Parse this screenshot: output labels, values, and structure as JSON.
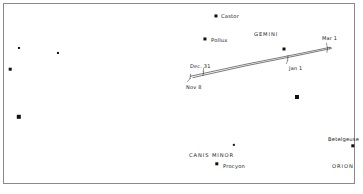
{
  "figure": {
    "kind": "star-chart",
    "background_color": "#ffffff",
    "frame_color": "#8a8a8a",
    "star_color": "#111111",
    "text_color": "#1a1a1a",
    "path_color": "#333333",
    "width": 363,
    "height": 194
  },
  "stars": [
    {
      "name": "castor-star",
      "x": 216,
      "y": 16,
      "size": 3.1
    },
    {
      "name": "pollux-star",
      "x": 205,
      "y": 39,
      "size": 3.1
    },
    {
      "name": "gemini-star-1",
      "x": 284,
      "y": 49,
      "size": 3.0
    },
    {
      "name": "field-star-left-1",
      "x": 19,
      "y": 48,
      "size": 2.1
    },
    {
      "name": "field-star-left-2",
      "x": 58,
      "y": 53,
      "size": 2.1
    },
    {
      "name": "field-star-left-3",
      "x": 10,
      "y": 69,
      "size": 2.6
    },
    {
      "name": "field-star-left-4",
      "x": 19,
      "y": 117,
      "size": 4.4
    },
    {
      "name": "field-star-mid-1",
      "x": 297,
      "y": 97,
      "size": 4.0
    },
    {
      "name": "canis-minor-star",
      "x": 234,
      "y": 145,
      "size": 2.3
    },
    {
      "name": "procyon-star",
      "x": 217,
      "y": 164,
      "size": 3.4
    },
    {
      "name": "betelgeuse-star",
      "x": 353,
      "y": 146,
      "size": 3.4
    }
  ],
  "star_labels": [
    {
      "name": "castor-label",
      "text": "Castor",
      "x": 221,
      "y": 16
    },
    {
      "name": "pollux-label",
      "text": "Pollux",
      "x": 211,
      "y": 40
    },
    {
      "name": "procyon-label",
      "text": "Procyon",
      "x": 223,
      "y": 166
    },
    {
      "name": "betelgeuse-label",
      "text": "Betelgeuse",
      "x": 328,
      "y": 139
    }
  ],
  "constellation_labels": [
    {
      "name": "gemini-label",
      "text": "GEMINI",
      "x": 254,
      "y": 34
    },
    {
      "name": "canis-minor-label",
      "text": "CANIS MINOR",
      "x": 189,
      "y": 155
    },
    {
      "name": "orion-label",
      "text": "ORION",
      "x": 332,
      "y": 166
    }
  ],
  "date_labels": [
    {
      "name": "date-label-nov-8",
      "text": "Nov 8",
      "x": 186,
      "y": 87
    },
    {
      "name": "date-label-dec-31",
      "text": "Dec. 31",
      "x": 190,
      "y": 66
    },
    {
      "name": "date-label-jan-1",
      "text": "Jan 1",
      "x": 289,
      "y": 68
    },
    {
      "name": "date-label-mar-1",
      "text": "Mar 1",
      "x": 322,
      "y": 38
    }
  ],
  "path": {
    "name": "planet-retrograde-path",
    "description": "Apparent path of planet from Nov 8 through Mar 1 forming a narrow retrograde loop",
    "outbound": "M 190.5 76.2 L 246 64.2 L 300 53.5 L 329.5 47.4",
    "return": "M 329.5 48.8 L 300 55.0 L 246 65.8 L 193.0 77.6",
    "loop_cap": "M 329.5 47.4 C 332.2 47.4 332.6 48.8 329.5 48.8",
    "ticks": [
      {
        "name": "tick-nov-8",
        "d": "M 190.6 74.2 L 190.0 78.4"
      },
      {
        "name": "tick-dec-31",
        "d": "M 203.6 71.6 L 203.0 75.6"
      },
      {
        "name": "tick-jan-1",
        "d": "M 288.0 55.6 L 287.6 60.2"
      },
      {
        "name": "tick-mar-1",
        "d": "M 327.6 47.7 L 327.0 52.2"
      }
    ],
    "leaders": [
      {
        "name": "leader-nov-8",
        "d": "M 190.2 78.4 L 187.5 81.6"
      },
      {
        "name": "leader-dec-31",
        "d": "M 203.2 71.6 L 203.6 68.2"
      },
      {
        "name": "leader-jan-1",
        "d": "M 287.8 60.2 L 286.4 63.6"
      },
      {
        "name": "leader-mar-1",
        "d": "M 327.4 47.7 L 326.4 43.2"
      }
    ]
  }
}
